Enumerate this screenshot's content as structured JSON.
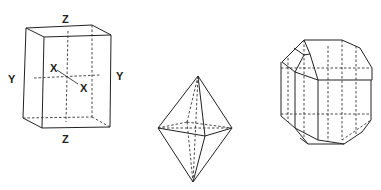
{
  "figure": {
    "box": {
      "labels": {
        "z_top": "Z",
        "z_bottom": "Z",
        "y_left": "Y",
        "y_right": "Y",
        "x_back": "X",
        "x_front": "X"
      }
    },
    "octahedron": {},
    "modified_prism": {}
  },
  "colors": {
    "line": "#222222",
    "background": "#ffffff"
  }
}
